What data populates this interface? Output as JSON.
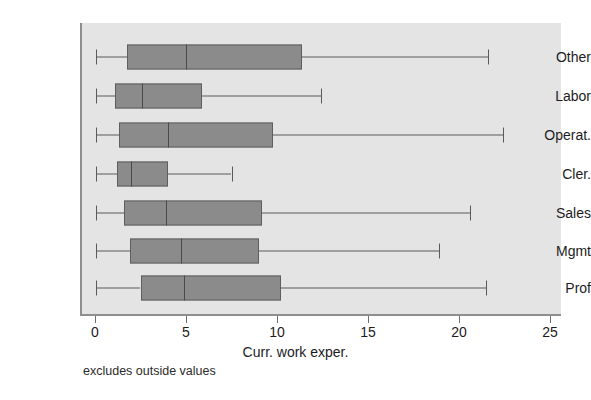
{
  "chart_data": {
    "type": "box",
    "orientation": "horizontal",
    "title": "",
    "xlabel": "Curr. work exper.",
    "ylabel": "",
    "xlim": [
      0,
      25
    ],
    "xticks": [
      0,
      5,
      10,
      15,
      20,
      25
    ],
    "xtick_labels": [
      "0",
      "5",
      "10",
      "15",
      "20",
      "25"
    ],
    "categories": [
      "Other",
      "Labor",
      "Operat.",
      "Cler.",
      "Sales",
      "Mgmt",
      "Prof"
    ],
    "grid": false,
    "legend": null,
    "footnote": "excludes outside values",
    "colors": {
      "box_fill": "#8b8b8b",
      "box_edge": "#5e5e5e",
      "whisker": "#5a5a5a",
      "median": "#4a4a4a",
      "plot_background": "#e4e4e4",
      "axis": "#8e8e8e",
      "text": "#1c1c1c"
    },
    "boxes": [
      {
        "label": "Other",
        "whisker_low": 0.05,
        "q1": 1.75,
        "median": 5.0,
        "q3": 11.4,
        "whisker_high": 21.6
      },
      {
        "label": "Labor",
        "whisker_low": 0.05,
        "q1": 1.1,
        "median": 2.6,
        "q3": 5.9,
        "whisker_high": 12.4
      },
      {
        "label": "Operat.",
        "whisker_low": 0.05,
        "q1": 1.3,
        "median": 4.0,
        "q3": 9.8,
        "whisker_high": 22.4
      },
      {
        "label": "Cler.",
        "whisker_low": 0.05,
        "q1": 1.2,
        "median": 2.0,
        "q3": 4.0,
        "whisker_high": 7.5
      },
      {
        "label": "Sales",
        "whisker_low": 0.05,
        "q1": 1.6,
        "median": 3.9,
        "q3": 9.2,
        "whisker_high": 20.6
      },
      {
        "label": "Mgmt",
        "whisker_low": 0.05,
        "q1": 1.9,
        "median": 4.7,
        "q3": 9.0,
        "whisker_high": 18.9
      },
      {
        "label": "Prof",
        "whisker_low": 0.05,
        "q1": 2.5,
        "median": 4.9,
        "q3": 10.2,
        "whisker_high": 21.5
      }
    ]
  },
  "layout": {
    "plot_left_px": 82,
    "plot_top_px": 23,
    "plot_width_px": 479,
    "plot_height_px": 291,
    "x_zero_px": 95,
    "x_scale_px_per_unit": 18.2,
    "row_centers_px": [
      57,
      96,
      135,
      174,
      213,
      251,
      288
    ],
    "box_height_px": 25,
    "whisker_cap_height_px": 15
  }
}
